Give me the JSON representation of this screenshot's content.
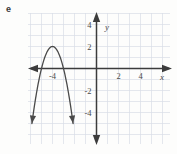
{
  "figure": {
    "part_label": "e",
    "background_color": "#fdfdfc",
    "grid_color": "#d8dde6",
    "axis_color": "#3c3c3c",
    "curve_color": "#4a4a4a"
  },
  "chart_data": {
    "type": "line",
    "title": "",
    "subtitle": "",
    "xlabel": "x",
    "ylabel": "y",
    "xlim": [
      -6.2,
      6.7
    ],
    "ylim": [
      -5.0,
      5.9
    ],
    "grid": true,
    "legend": null,
    "xticks": [
      -4,
      2,
      4
    ],
    "xtick_labels": [
      "-4",
      "2",
      "4"
    ],
    "yticks": [
      4,
      2,
      -2,
      -4
    ],
    "ytick_labels": [
      "4",
      "2",
      "-2",
      "-4"
    ],
    "axis_arrows": [
      "left",
      "right",
      "up",
      "down"
    ],
    "series": [
      {
        "name": "parabola",
        "shape": "downward-opening parabola",
        "equation": "y = -2(x + 4)^2 + 2",
        "vertex": [
          -4,
          2
        ],
        "roots": [
          -5,
          -3
        ],
        "opens": "down",
        "endpoint_arrows": true,
        "x": [
          -5.5,
          -5.25,
          -5.0,
          -4.75,
          -4.5,
          -4.25,
          -4.0,
          -3.75,
          -3.5,
          -3.25,
          -3.0,
          -2.75,
          -2.5
        ],
        "y": [
          -2.5,
          -1.125,
          0.0,
          0.875,
          1.5,
          1.875,
          2.0,
          1.875,
          1.5,
          0.875,
          0.0,
          -1.125,
          -2.5
        ]
      }
    ]
  },
  "axis_letters": {
    "x": "x",
    "y": "y"
  }
}
